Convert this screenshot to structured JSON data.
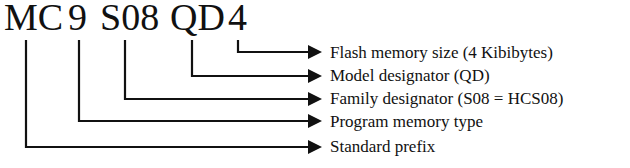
{
  "part_number": {
    "segments": [
      {
        "text": "MC",
        "x": 4
      },
      {
        "text": "9",
        "x": 68
      },
      {
        "text": "S08",
        "x": 100
      },
      {
        "text": "QD",
        "x": 170
      },
      {
        "text": "4",
        "x": 228
      }
    ]
  },
  "callouts": [
    {
      "segment": "4",
      "label": "Flash memory size (4 Kibibytes)",
      "line_x": 238,
      "y": 52
    },
    {
      "segment": "QD",
      "label": "Model designator (QD)",
      "line_x": 192,
      "y": 76
    },
    {
      "segment": "S08",
      "label": "Family designator (S08 = HCS08)",
      "line_x": 125,
      "y": 99
    },
    {
      "segment": "9",
      "label": "Program memory type",
      "line_x": 79,
      "y": 121
    },
    {
      "segment": "MC",
      "label": "Standard prefix",
      "line_x": 26,
      "y": 147
    }
  ],
  "colors": {
    "ink": "#111111",
    "background": "#ffffff"
  }
}
